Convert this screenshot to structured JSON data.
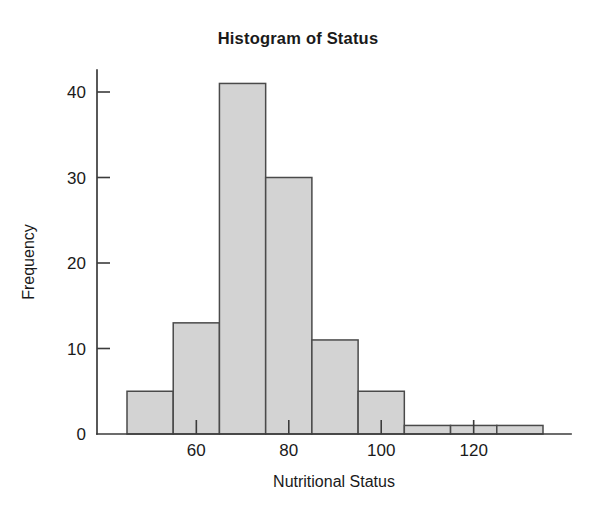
{
  "chart_data": {
    "type": "bar",
    "title": "Histogram of Status",
    "xlabel": "Nutritional Status",
    "ylabel": "Frequency",
    "bin_width": 10,
    "bin_edges": [
      45,
      55,
      65,
      75,
      85,
      95,
      105,
      115,
      125,
      135
    ],
    "categories": [
      "45-55",
      "55-65",
      "65-75",
      "75-85",
      "85-95",
      "95-105",
      "105-115",
      "115-125",
      "125-135"
    ],
    "values": [
      5,
      13,
      41,
      30,
      11,
      5,
      1,
      1,
      1
    ],
    "x_ticks": [
      60,
      80,
      100,
      120
    ],
    "x_tick_labels": [
      "60",
      "80",
      "100",
      "120"
    ],
    "y_ticks": [
      0,
      10,
      20,
      30,
      40
    ],
    "y_tick_labels": [
      "0",
      "10",
      "20",
      "30",
      "40"
    ],
    "xlim": [
      45,
      140
    ],
    "ylim": [
      0,
      41
    ],
    "grid": false,
    "legend": false,
    "bar_fill_color": "#d3d3d3",
    "bar_edge_color": "#4a4a4a",
    "axis_color": "#3b3b3b",
    "background_color": "#ffffff"
  },
  "figure": {
    "title": "Histogram of Status",
    "x_axis_title": "Nutritional Status",
    "y_axis_title": "Frequency"
  }
}
